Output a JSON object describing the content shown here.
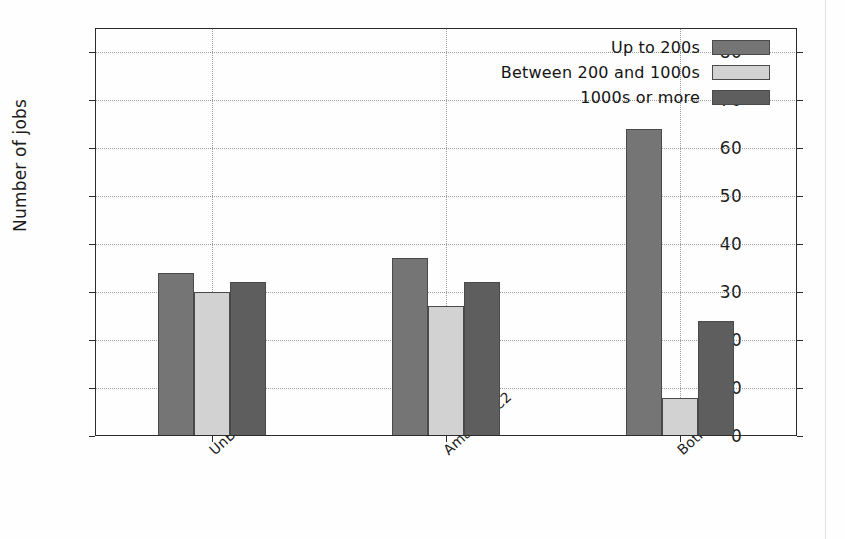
{
  "chart_data": {
    "type": "bar",
    "title": "",
    "xlabel": "",
    "ylabel": "Number of jobs",
    "categories": [
      "UnB",
      "AmazonEC2",
      "Both"
    ],
    "series": [
      {
        "name": "Up to 200s",
        "values": [
          34,
          37,
          64
        ],
        "color": "#757575"
      },
      {
        "name": "Between 200 and 1000s",
        "values": [
          30,
          27,
          8
        ],
        "color": "#d2d2d2"
      },
      {
        "name": "1000s or more",
        "values": [
          32,
          32,
          24
        ],
        "color": "#5e5e5e"
      }
    ],
    "ylim": [
      0,
      85
    ],
    "yticks": [
      0,
      10,
      20,
      30,
      40,
      50,
      60,
      70,
      80
    ],
    "ytick_labels": [
      "0",
      "10",
      "20",
      "30",
      "40",
      "50",
      "60",
      "70",
      "80"
    ],
    "grid": "dotted both axes",
    "legend_position": "upper right (inside axes)"
  },
  "figure": {
    "background_color": "#fefefe",
    "axis_color": "#2c2c2c",
    "grid_color": "#9a9a9a"
  },
  "legend": {
    "entries": [
      {
        "label": "Up to 200s"
      },
      {
        "label": "Between 200 and 1000s"
      },
      {
        "label": "1000s or more"
      }
    ]
  }
}
